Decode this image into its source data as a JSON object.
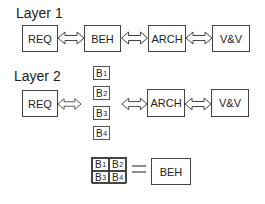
{
  "layer1": {
    "title": "Layer 1",
    "boxes": [
      "REQ",
      "BEH",
      "ARCH",
      "V&V"
    ]
  },
  "layer2": {
    "title": "Layer 2",
    "boxes": [
      "REQ",
      "ARCH",
      "V&V"
    ],
    "sub_blocks": [
      {
        "base": "B",
        "sub": "1"
      },
      {
        "base": "B",
        "sub": "2"
      },
      {
        "base": "B",
        "sub": "3"
      },
      {
        "base": "B",
        "sub": "4"
      }
    ]
  },
  "equation": {
    "grid": [
      {
        "base": "B",
        "sub": "1"
      },
      {
        "base": "B",
        "sub": "2"
      },
      {
        "base": "B",
        "sub": "3"
      },
      {
        "base": "B",
        "sub": "4"
      }
    ],
    "operator": "=",
    "result": "BEH"
  },
  "icons": {
    "arrow": "double-headed-hollow-arrow"
  },
  "colors": {
    "stroke": "#444444",
    "text": "#222222",
    "background": "#ffffff"
  }
}
